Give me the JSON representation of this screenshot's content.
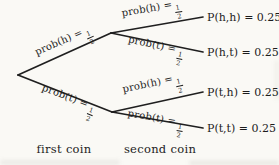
{
  "tree": {
    "branch_labels": [
      {
        "prefix": "prob(h) =",
        "frac_num": "1",
        "frac_den": "2"
      },
      {
        "prefix": "prob(t) =",
        "frac_num": "1",
        "frac_den": "2"
      },
      {
        "prefix": "prob(h) =",
        "frac_num": "1",
        "frac_den": "2"
      },
      {
        "prefix": "prob(t) =",
        "frac_num": "1",
        "frac_den": "2"
      },
      {
        "prefix": "prob(h) =",
        "frac_num": "1",
        "frac_den": "2"
      },
      {
        "prefix": "prob(t) =",
        "frac_num": "1",
        "frac_den": "2"
      }
    ],
    "leaves": [
      "P(h,h) = 0.25",
      "P(h,t) = 0.25",
      "P(t,h) = 0.25",
      "P(t,t) = 0.25"
    ],
    "leaf_values": [
      0.25,
      0.25,
      0.25,
      0.25
    ],
    "stage_labels": [
      "first coin",
      "second coin"
    ],
    "colors": {
      "ink": "#1c1c1c",
      "paper": "#faf9f5"
    }
  }
}
